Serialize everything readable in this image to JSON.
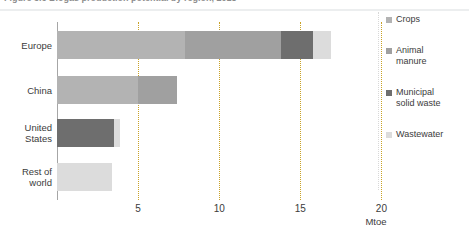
{
  "figure": {
    "caption": "Figure 3.6  Biogas production potential by region, 2018",
    "unit_label": "Mtoe"
  },
  "chart_data": {
    "type": "bar",
    "orientation": "horizontal",
    "stacked": true,
    "title": "",
    "xlabel": "Mtoe",
    "ylabel": "",
    "xlim": [
      0,
      21.5
    ],
    "grid": true,
    "gridlines": [
      5,
      10,
      15,
      20
    ],
    "tick_labels": [
      "5",
      "10",
      "15",
      "20"
    ],
    "legend_position": "right",
    "categories": [
      "Europe",
      "China",
      "United States",
      "Rest of world"
    ],
    "category_labels": [
      [
        "Europe"
      ],
      [
        "China"
      ],
      [
        "United",
        "States"
      ],
      [
        "Rest of",
        "world"
      ]
    ],
    "series": [
      {
        "name": "Crops",
        "color": "#b3b3b3",
        "values": [
          7.9,
          5.0,
          0.0,
          0.0
        ]
      },
      {
        "name": "Animal manure",
        "color": "#a0a0a0",
        "values": [
          5.9,
          2.4,
          0.0,
          0.0
        ]
      },
      {
        "name": "Municipal solid waste",
        "color": "#6e6e6e",
        "values": [
          2.0,
          0.0,
          3.5,
          0.0
        ]
      },
      {
        "name": "Wastewater",
        "color": "#dcdcdc",
        "values": [
          1.1,
          0.0,
          0.4,
          3.4
        ]
      }
    ],
    "totals": [
      16.9,
      7.4,
      3.9,
      3.4
    ]
  },
  "legend": {
    "items": [
      {
        "label": "Crops",
        "lines": [
          "Crops"
        ],
        "color": "#b3b3b3"
      },
      {
        "label": "Animal manure",
        "lines": [
          "Animal",
          "manure"
        ],
        "color": "#a0a0a0"
      },
      {
        "label": "Municipal solid waste",
        "lines": [
          "Municipal",
          "solid waste"
        ],
        "color": "#6e6e6e"
      },
      {
        "label": "Wastewater",
        "lines": [
          "Wastewater"
        ],
        "color": "#dcdcdc"
      }
    ]
  },
  "colors": {
    "axis": "#a6a6a6",
    "gridline": "#c9a227",
    "text": "#3b3b3b",
    "background": "#ffffff"
  }
}
